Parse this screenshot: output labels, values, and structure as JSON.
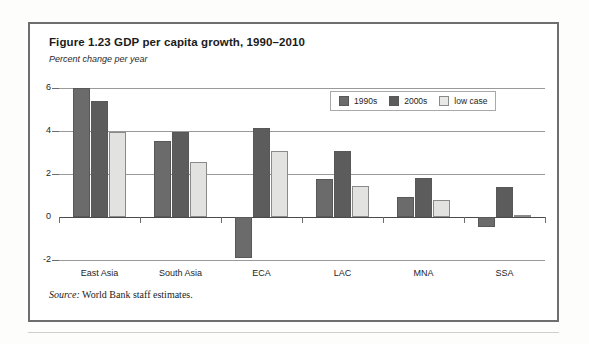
{
  "figure": {
    "title": "Figure 1.23  GDP per capita growth, 1990–2010",
    "subtitle": "Percent change per year",
    "source_prefix": "Source:",
    "source_text": " World Bank staff estimates."
  },
  "colors": {
    "series_1990s": "#6b6b6b",
    "series_2000s": "#5c5c5c",
    "series_low_case": "#e2e2e0",
    "frame": "#6e6e6e",
    "gridline": "#9a9a9a",
    "axis": "#4a4a4a"
  },
  "chart_data": {
    "type": "bar",
    "title": "Figure 1.23  GDP per capita growth, 1990–2010",
    "subtitle": "Percent change per year",
    "xlabel": "",
    "ylabel": "Percent change per year",
    "ylim": [
      -2,
      6
    ],
    "yticks": [
      6,
      4,
      2,
      0,
      -2
    ],
    "ytick_labels": [
      "6",
      "4",
      "2",
      "0",
      "-2"
    ],
    "grid": true,
    "legend_position": "top-right",
    "categories": [
      "East Asia",
      "South Asia",
      "ECA",
      "LAC",
      "MNA",
      "SSA"
    ],
    "series": [
      {
        "name": "1990s",
        "values": [
          6.0,
          3.55,
          -1.9,
          1.75,
          0.95,
          -0.45
        ]
      },
      {
        "name": "2000s",
        "values": [
          5.4,
          3.95,
          4.15,
          3.05,
          1.8,
          1.4
        ]
      },
      {
        "name": "low case",
        "values": [
          3.95,
          2.55,
          3.05,
          1.45,
          0.8,
          0.1
        ]
      }
    ]
  }
}
